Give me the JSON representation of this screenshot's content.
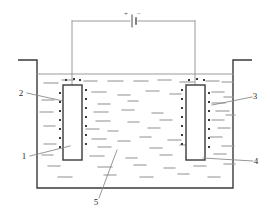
{
  "figure": {
    "type": "electrolysis-cell-diagram",
    "background_color": "#ffffff",
    "line_color": "#4a4a4a",
    "dark_line_color": "#3a3a3a",
    "faint_line_color": "#9a9a9a",
    "width": 270,
    "height": 218
  },
  "circuit": {
    "battery": {
      "plus_sign": "+",
      "minus_sign": "−",
      "plus_x": 126,
      "plus_y": 16,
      "minus_x": 139,
      "minus_y": 16,
      "long_plate_x": 132,
      "short_plate_x": 136,
      "wire_y": 21,
      "left_x": 72,
      "right_x": 195
    }
  },
  "tank": {
    "left_wall_x": 37,
    "right_wall_x": 233,
    "top_y": 60,
    "bottom_y": 188,
    "rim_left_outer_x": 18,
    "rim_right_outer_x": 252,
    "liquid_surface_y": 74
  },
  "electrodes": {
    "left": {
      "x": 63,
      "y": 85,
      "width": 19,
      "height": 75,
      "lead_x": 72,
      "lead_top_y": 21
    },
    "right": {
      "x": 186,
      "y": 85,
      "width": 19,
      "height": 75,
      "lead_x": 195,
      "lead_top_y": 21
    }
  },
  "labels": [
    {
      "id": "label-1",
      "text": "1",
      "x": 24,
      "y": 159,
      "leader": [
        [
          30,
          156
        ],
        [
          70,
          146
        ]
      ]
    },
    {
      "id": "label-2",
      "text": "2",
      "x": 21,
      "y": 96,
      "leader": [
        [
          27,
          93
        ],
        [
          63,
          101
        ]
      ]
    },
    {
      "id": "label-3",
      "text": "3",
      "x": 255,
      "y": 99,
      "leader": [
        [
          252,
          97
        ],
        [
          212,
          105
        ]
      ]
    },
    {
      "id": "label-4",
      "text": "4",
      "x": 256,
      "y": 164,
      "leader": [
        [
          253,
          161
        ],
        [
          203,
          158
        ]
      ]
    },
    {
      "id": "label-5",
      "text": "5",
      "x": 96,
      "y": 205,
      "leader": [
        [
          99,
          198
        ],
        [
          117,
          150
        ]
      ]
    }
  ],
  "liquid_dashes": [
    [
      44,
      83,
      14
    ],
    [
      62,
      80,
      12
    ],
    [
      84,
      81,
      13
    ],
    [
      108,
      81,
      15
    ],
    [
      134,
      81,
      14
    ],
    [
      158,
      80,
      13
    ],
    [
      180,
      82,
      14
    ],
    [
      206,
      81,
      13
    ],
    [
      222,
      82,
      11
    ],
    [
      92,
      92,
      14
    ],
    [
      118,
      95,
      12
    ],
    [
      146,
      91,
      13
    ],
    [
      170,
      94,
      11
    ],
    [
      212,
      92,
      12
    ],
    [
      42,
      100,
      12
    ],
    [
      98,
      104,
      12
    ],
    [
      128,
      101,
      10
    ],
    [
      212,
      103,
      13
    ],
    [
      224,
      97,
      9
    ],
    [
      40,
      112,
      13
    ],
    [
      94,
      112,
      14
    ],
    [
      122,
      110,
      12
    ],
    [
      152,
      113,
      11
    ],
    [
      216,
      111,
      13
    ],
    [
      96,
      121,
      14
    ],
    [
      128,
      122,
      11
    ],
    [
      160,
      120,
      12
    ],
    [
      212,
      120,
      12
    ],
    [
      226,
      115,
      9
    ],
    [
      44,
      126,
      11
    ],
    [
      86,
      129,
      13
    ],
    [
      108,
      131,
      10
    ],
    [
      148,
      128,
      12
    ],
    [
      218,
      128,
      12
    ],
    [
      92,
      139,
      14
    ],
    [
      118,
      141,
      12
    ],
    [
      140,
      137,
      11
    ],
    [
      168,
      140,
      13
    ],
    [
      210,
      137,
      12
    ],
    [
      44,
      144,
      12
    ],
    [
      98,
      147,
      13
    ],
    [
      150,
      148,
      12
    ],
    [
      180,
      145,
      12
    ],
    [
      222,
      146,
      12
    ],
    [
      42,
      155,
      11
    ],
    [
      90,
      156,
      14
    ],
    [
      126,
      158,
      11
    ],
    [
      160,
      155,
      12
    ],
    [
      186,
      158,
      11
    ],
    [
      214,
      154,
      12
    ],
    [
      48,
      166,
      12
    ],
    [
      98,
      167,
      14
    ],
    [
      134,
      165,
      12
    ],
    [
      164,
      168,
      11
    ],
    [
      194,
      166,
      12
    ],
    [
      224,
      164,
      11
    ],
    [
      58,
      177,
      14
    ],
    [
      104,
      175,
      12
    ],
    [
      140,
      177,
      13
    ],
    [
      178,
      174,
      11
    ],
    [
      208,
      177,
      12
    ]
  ],
  "charge_dots": {
    "note": "small square ion markers along electrode faces",
    "left_outer": [
      [
        60,
        93
      ],
      [
        60,
        102
      ],
      [
        60,
        111
      ],
      [
        60,
        120
      ],
      [
        60,
        129
      ],
      [
        60,
        138
      ],
      [
        60,
        147
      ]
    ],
    "left_inner": [
      [
        86,
        90
      ],
      [
        86,
        99
      ],
      [
        86,
        108
      ],
      [
        86,
        117
      ],
      [
        86,
        126
      ],
      [
        86,
        135
      ],
      [
        86,
        144
      ]
    ],
    "left_top": [
      [
        66,
        80
      ],
      [
        74,
        79
      ],
      [
        80,
        80
      ]
    ],
    "right_outer": [
      [
        209,
        93
      ],
      [
        209,
        102
      ],
      [
        209,
        111
      ],
      [
        209,
        120
      ],
      [
        209,
        129
      ],
      [
        209,
        138
      ],
      [
        209,
        147
      ]
    ],
    "right_inner": [
      [
        182,
        90
      ],
      [
        182,
        99
      ],
      [
        182,
        108
      ],
      [
        182,
        117
      ],
      [
        182,
        126
      ],
      [
        182,
        135
      ],
      [
        182,
        144
      ]
    ],
    "right_top": [
      [
        189,
        80
      ],
      [
        197,
        79
      ],
      [
        204,
        80
      ]
    ]
  }
}
